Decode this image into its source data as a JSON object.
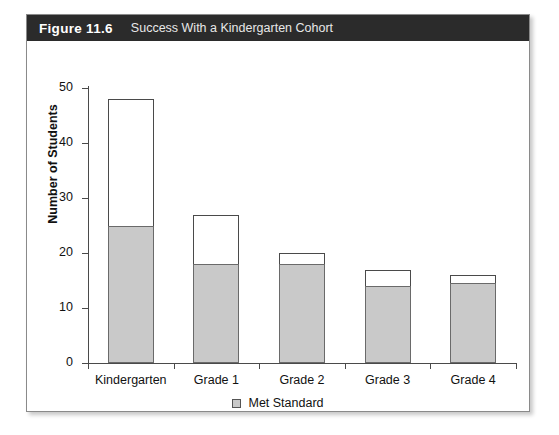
{
  "figure": {
    "number_label": "Figure 11.6",
    "title": "Success With a Kindergarten Cohort"
  },
  "chart_data": {
    "type": "bar",
    "title": "Success With a Kindergarten Cohort",
    "xlabel": "",
    "ylabel": "Number of Students",
    "ylim": [
      0,
      50
    ],
    "yticks": [
      0,
      10,
      20,
      30,
      40,
      50
    ],
    "ytick_labels": [
      "0",
      "10",
      "20",
      "30",
      "40",
      "50"
    ],
    "grid": false,
    "stacked": true,
    "legend_position": "bottom-center",
    "categories": [
      "Kindergarten",
      "Grade 1",
      "Grade 2",
      "Grade 3",
      "Grade 4"
    ],
    "series": [
      {
        "name": "Met Standard",
        "fill": "#c9c9c9",
        "values": [
          25,
          18,
          18,
          14,
          14.5
        ]
      },
      {
        "name": "Total Students",
        "fill": "#ffffff",
        "values": [
          48,
          27,
          20,
          17,
          16
        ]
      }
    ],
    "legend": [
      {
        "label": "Met Standard",
        "swatch": "#c9c9c9"
      }
    ],
    "colors": {
      "met_standard_fill": "#c9c9c9",
      "total_fill": "#ffffff",
      "bar_outline": "#4a4a4a",
      "axis": "#4a4a4a",
      "title_bar": "#2b2b2b",
      "card_border": "#8a8a8a"
    }
  }
}
